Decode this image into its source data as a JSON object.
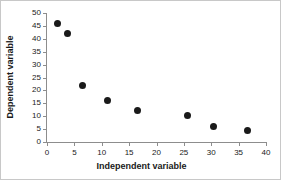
{
  "chart_data": {
    "type": "scatter",
    "title": "",
    "xlabel": "Independent variable",
    "ylabel": "Dependent variable",
    "xlim": [
      0,
      40
    ],
    "ylim": [
      0,
      50
    ],
    "xticks": [
      0,
      5,
      10,
      15,
      20,
      25,
      30,
      35,
      40
    ],
    "yticks": [
      0,
      5,
      10,
      15,
      20,
      25,
      30,
      35,
      40,
      45,
      50
    ],
    "xtick_labels": [
      "0",
      "5",
      "10",
      "15",
      "20",
      "25",
      "30",
      "35",
      "40"
    ],
    "ytick_labels": [
      "0",
      "5",
      "10",
      "15",
      "20",
      "25",
      "30",
      "35",
      "40",
      "45",
      "50"
    ],
    "grid": false,
    "legend": false,
    "marker": "filled-circle",
    "marker_color": "#1a1a1a",
    "axis_color": "#8d8d8d",
    "background": "#ffffff",
    "points": [
      {
        "x": 2.0,
        "y": 46.0
      },
      {
        "x": 3.8,
        "y": 42.0
      },
      {
        "x": 6.4,
        "y": 22.0
      },
      {
        "x": 11.1,
        "y": 15.9
      },
      {
        "x": 16.6,
        "y": 12.4
      },
      {
        "x": 25.6,
        "y": 10.1
      },
      {
        "x": 30.5,
        "y": 6.2
      },
      {
        "x": 36.7,
        "y": 4.3
      }
    ]
  }
}
